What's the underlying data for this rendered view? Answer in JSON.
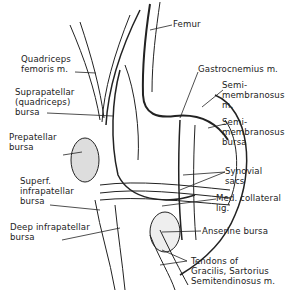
{
  "diagram": {
    "labels": {
      "femur": "Femur",
      "quadriceps_femoris": "Quadriceps\nfemoris m.",
      "suprapatellar_bursa": "Suprapatellar\n(quadriceps)\nbursa",
      "prepatellar_bursa": "Prepatellar\nbursa",
      "superf_infrapatellar_bursa": "Superf.\ninfrapatellar\nbursa",
      "deep_infrapatellar_bursa": "Deep infrapatellar\nbursa",
      "gastrocnemius": "Gastrocnemius m.",
      "semimembranosus_m": "Semi-\nmembranosus\nm.",
      "semimembranosus_bursa": "Semi-\nmembranosus\nbursa",
      "synovial_sacs": "Synovial\nsacs",
      "med_collateral_lig": "Med. collateral\nlig.",
      "anserine_bursa": "Anserine bursa",
      "tendons": "Tendons of\nGracilis, Sartorius\nSemitendinosus m."
    }
  }
}
